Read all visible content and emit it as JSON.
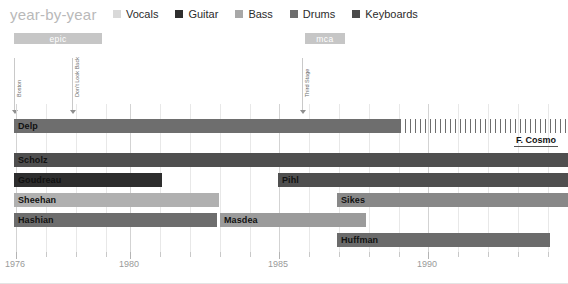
{
  "header": {
    "title": "year-by-year"
  },
  "legend": {
    "items": [
      {
        "label": "Vocals",
        "color": "#d9d9d9"
      },
      {
        "label": "Guitar",
        "color": "#2e2e2e"
      },
      {
        "label": "Bass",
        "color": "#a8a8a8"
      },
      {
        "label": "Drums",
        "color": "#6d6d6d"
      },
      {
        "label": "Keyboards",
        "color": "#4a4a4a"
      }
    ]
  },
  "record_labels": [
    {
      "name": "epic",
      "left": 14,
      "width": 88,
      "top": 33
    },
    {
      "name": "mca",
      "left": 305,
      "width": 40,
      "top": 33
    }
  ],
  "albums": [
    {
      "name": "Boston",
      "x": 14
    },
    {
      "name": "Don't Look Back",
      "x": 72
    },
    {
      "name": "Third Stage",
      "x": 302
    }
  ],
  "chart_data": {
    "type": "bar",
    "title": "year-by-year",
    "xlabel": "",
    "ylabel": "",
    "xlim": [
      1976,
      1994.2
    ],
    "grid": true,
    "legend_position": "top",
    "axis_ticks": [
      {
        "year": 1976,
        "label": "1976",
        "x": 16,
        "major": true
      },
      {
        "year": 1977,
        "label": "",
        "x": 46,
        "major": false
      },
      {
        "year": 1978,
        "label": "",
        "x": 76,
        "major": false
      },
      {
        "year": 1979,
        "label": "",
        "x": 106,
        "major": false
      },
      {
        "year": 1980,
        "label": "1980",
        "x": 130,
        "major": true
      },
      {
        "year": 1981,
        "label": "",
        "x": 160,
        "major": false
      },
      {
        "year": 1982,
        "label": "",
        "x": 190,
        "major": false
      },
      {
        "year": 1983,
        "label": "",
        "x": 220,
        "major": false
      },
      {
        "year": 1984,
        "label": "",
        "x": 250,
        "major": false
      },
      {
        "year": 1985,
        "label": "1985",
        "x": 279,
        "major": true
      },
      {
        "year": 1986,
        "label": "",
        "x": 309,
        "major": false
      },
      {
        "year": 1987,
        "label": "",
        "x": 339,
        "major": false
      },
      {
        "year": 1988,
        "label": "",
        "x": 369,
        "major": false
      },
      {
        "year": 1989,
        "label": "",
        "x": 399,
        "major": false
      },
      {
        "year": 1990,
        "label": "1990",
        "x": 428,
        "major": true
      },
      {
        "year": 1991,
        "label": "",
        "x": 458,
        "major": false
      },
      {
        "year": 1992,
        "label": "",
        "x": 488,
        "major": false
      },
      {
        "year": 1993,
        "label": "",
        "x": 518,
        "major": false
      },
      {
        "year": 1994,
        "label": "",
        "x": 548,
        "major": false
      }
    ],
    "rows": [
      {
        "row": 0,
        "top": 14,
        "bars": [
          {
            "name": "Delp",
            "role": "Vocals",
            "start_year": 1976,
            "end_year": 1989.4,
            "left": 14,
            "width": 386,
            "color": "#6e6e6e",
            "style": "solid",
            "label_color": "dark"
          }
        ],
        "dashed": {
          "left": 400,
          "width": 168,
          "color": "#6e6e6e"
        },
        "annotation": {
          "text": "F. Cosmo",
          "left": 514,
          "top": 31
        }
      },
      {
        "row": 1,
        "top": 48,
        "bars": [
          {
            "name": "Scholz",
            "role": "Guitar",
            "start_year": 1976,
            "end_year": 1994.2,
            "left": 14,
            "width": 554,
            "color": "#4f4f4f",
            "style": "solid",
            "label_color": "dark"
          }
        ]
      },
      {
        "row": 2,
        "top": 68,
        "bars": [
          {
            "name": "Goudreau",
            "role": "Guitar",
            "start_year": 1976,
            "end_year": 1981.4,
            "left": 14,
            "width": 148,
            "color": "#2e2e2e",
            "style": "solid",
            "label_color": "dark"
          },
          {
            "name": "Pihl",
            "role": "Guitar",
            "start_year": 1985.1,
            "end_year": 1994.2,
            "left": 278,
            "width": 290,
            "color": "#4f4f4f",
            "style": "solid",
            "label_color": "dark"
          }
        ]
      },
      {
        "row": 3,
        "top": 88,
        "bars": [
          {
            "name": "Sheehan",
            "role": "Bass",
            "start_year": 1976,
            "end_year": 1982.9,
            "left": 14,
            "width": 205,
            "color": "#b0b0b0",
            "style": "solid",
            "label_color": "dark"
          },
          {
            "name": "Sikes",
            "role": "Bass",
            "start_year": 1987.1,
            "end_year": 1994.2,
            "left": 337,
            "width": 231,
            "color": "#888888",
            "style": "solid",
            "label_color": "dark"
          }
        ]
      },
      {
        "row": 4,
        "top": 108,
        "bars": [
          {
            "name": "Hashian",
            "role": "Drums",
            "start_year": 1976,
            "end_year": 1982.8,
            "left": 14,
            "width": 203,
            "color": "#6d6d6d",
            "style": "solid",
            "label_color": "dark"
          },
          {
            "name": "Masdea",
            "role": "Drums",
            "start_year": 1982.9,
            "end_year": 1987.2,
            "left": 220,
            "width": 146,
            "color": "#9b9b9b",
            "style": "solid",
            "label_color": "dark"
          }
        ]
      },
      {
        "row": 5,
        "top": 128,
        "bars": [
          {
            "name": "Huffman",
            "role": "Keyboards",
            "start_year": 1987.2,
            "end_year": 1993.4,
            "left": 337,
            "width": 213,
            "color": "#6b6b6b",
            "style": "solid",
            "label_color": "dark"
          }
        ]
      }
    ]
  }
}
